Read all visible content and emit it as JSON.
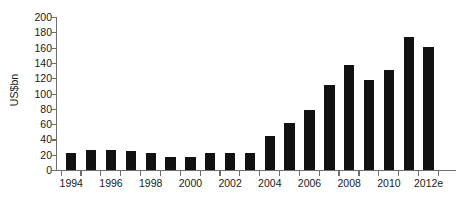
{
  "chart_data": {
    "type": "bar",
    "title": "",
    "xlabel": "",
    "ylabel": "US$bn",
    "ylim": [
      0,
      200
    ],
    "ytick_step": 20,
    "grid": false,
    "legend": "none",
    "bar_color": "#111111",
    "axis_color": "#6e6e6e",
    "text_color": "#1a1a1a",
    "background_color": "#ffffff",
    "ytick_labels": [
      "200",
      "180",
      "160",
      "140",
      "120",
      "100",
      "80",
      "60",
      "40",
      "20",
      "0"
    ],
    "ytick_values": [
      200,
      180,
      160,
      140,
      120,
      100,
      80,
      60,
      40,
      20,
      0
    ],
    "categories": [
      "1994",
      "1995",
      "1996",
      "1997",
      "1998",
      "1999",
      "2000",
      "2001",
      "2002",
      "2003",
      "2004",
      "2005",
      "2006",
      "2007",
      "2008",
      "2009",
      "2010",
      "2011",
      "2012e"
    ],
    "xtick_labels_shown": [
      "1994",
      "1996",
      "1998",
      "2000",
      "2002",
      "2004",
      "2006",
      "2008",
      "2010",
      "2012e"
    ],
    "values": [
      22,
      26,
      26,
      25,
      22,
      17,
      17,
      22,
      22,
      22,
      45,
      61,
      79,
      111,
      137,
      118,
      131,
      174,
      161
    ]
  }
}
